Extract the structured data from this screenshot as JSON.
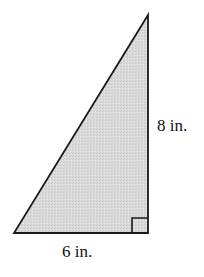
{
  "diagram": {
    "type": "right-triangle",
    "shape": "right triangle with right angle at bottom-right",
    "labels": {
      "height": "8 in.",
      "base": "6 in."
    },
    "measurements": {
      "height_value": 8,
      "base_value": 6,
      "unit": "in."
    },
    "colors": {
      "fill": "#d9d9d9",
      "stroke": "#1a1a1a",
      "text": "#111111",
      "background": "#ffffff"
    },
    "vertices": {
      "top": [
        148,
        15
      ],
      "bottom_left": [
        14,
        233
      ],
      "bottom_right": [
        148,
        233
      ]
    },
    "right_angle_marker": true
  }
}
